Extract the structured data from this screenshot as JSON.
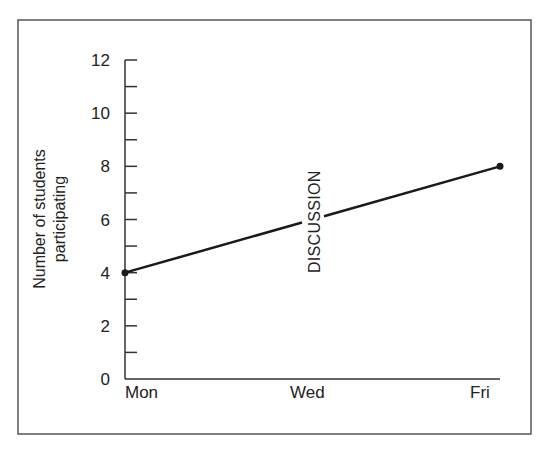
{
  "chart_data": {
    "type": "line",
    "title": "",
    "xlabel": "",
    "ylabel": "Number of students participating",
    "ylabel_lines": [
      "Number of students",
      "participating"
    ],
    "categories": [
      "Mon",
      "Wed",
      "Fri"
    ],
    "x_tick_labels": [
      "Mon",
      "Wed",
      "Fri"
    ],
    "y_tick_labels": [
      "0",
      "2",
      "4",
      "6",
      "8",
      "10",
      "12"
    ],
    "ylim": [
      0,
      12
    ],
    "y_major_step": 2,
    "y_minor_step": 1,
    "grid": false,
    "legend": null,
    "series": [
      {
        "name": "Participation",
        "x": [
          "Mon",
          "Fri"
        ],
        "values": [
          4,
          8
        ]
      }
    ],
    "annotations": [
      {
        "text": "DISCUSSION",
        "orientation": "vertical",
        "x": "Wed",
        "y_range": [
          4.5,
          9.5
        ]
      }
    ],
    "colors": {
      "line": "#1a1a1a",
      "axis": "#333333",
      "frame": "#555555"
    }
  }
}
